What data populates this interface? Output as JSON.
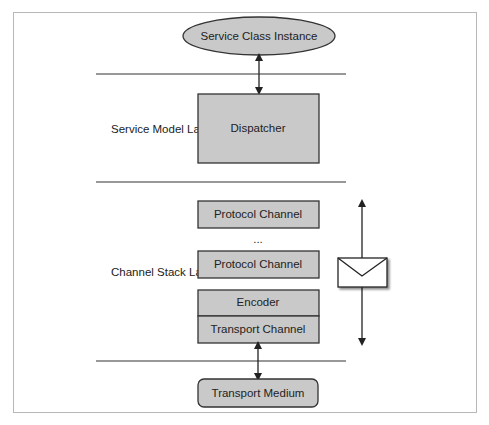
{
  "diagram": {
    "ellipse": {
      "label": "Service Class Instance"
    },
    "layers": {
      "service_model": "Service Model Layer",
      "channel_stack": "Channel Stack Layer"
    },
    "boxes": {
      "dispatcher": "Dispatcher",
      "protocol_channel_1": "Protocol Channel",
      "ellipsis": "...",
      "protocol_channel_2": "Protocol Channel",
      "encoder": "Encoder",
      "transport_channel": "Transport Channel",
      "transport_medium": "Transport Medium"
    },
    "colors": {
      "box_fill": "#c9c9c9",
      "stroke": "#333333",
      "frame": "#b8b8b8"
    }
  }
}
